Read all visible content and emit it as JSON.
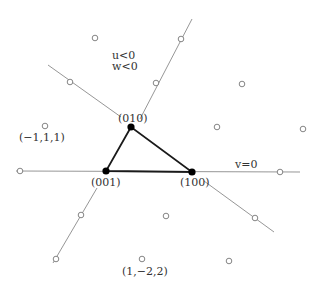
{
  "colors": {
    "background": "#ffffff",
    "thin_line": "#8a8a8a",
    "triangle": "#1a1a1a",
    "vertex": "#000000",
    "open_point_stroke": "#777777",
    "text": "#333333"
  },
  "labels": {
    "vertex_010": "(010)",
    "vertex_001": "(001)",
    "vertex_100": "(100)",
    "region_u": "u<0",
    "region_w": "w<0",
    "line_v0": "v=0",
    "point_m111": "(−1,1,1)",
    "point_1m22": "(1,−2,2)"
  },
  "diagram": {
    "vertices": [
      {
        "id": "010",
        "x": 131,
        "y": 127
      },
      {
        "id": "001",
        "x": 106,
        "y": 171
      },
      {
        "id": "100",
        "x": 192,
        "y": 172
      }
    ],
    "lines": [
      {
        "id": "v0-line",
        "x1": 16,
        "y1": 171,
        "x2": 300,
        "y2": 172
      },
      {
        "id": "upper-left-ray",
        "x1": 48,
        "y1": 65,
        "x2": 121,
        "y2": 117
      },
      {
        "id": "upper-right-ray",
        "x1": 140,
        "y1": 119,
        "x2": 192,
        "y2": 19
      },
      {
        "id": "lower-left-ray",
        "x1": 97,
        "y1": 188,
        "x2": 53,
        "y2": 263
      },
      {
        "id": "lower-right-ray",
        "x1": 204,
        "y1": 181,
        "x2": 274,
        "y2": 232
      }
    ],
    "open_points": [
      {
        "x": 20,
        "y": 171
      },
      {
        "x": 280,
        "y": 172
      },
      {
        "x": 70,
        "y": 82
      },
      {
        "x": 181,
        "y": 39
      },
      {
        "x": 156,
        "y": 83
      },
      {
        "x": 81,
        "y": 215
      },
      {
        "x": 56,
        "y": 259
      },
      {
        "x": 255,
        "y": 218
      },
      {
        "x": 95,
        "y": 38
      },
      {
        "x": 242,
        "y": 84
      },
      {
        "x": 217,
        "y": 127
      },
      {
        "x": 303,
        "y": 129
      },
      {
        "x": 166,
        "y": 216
      },
      {
        "x": 229,
        "y": 261
      },
      {
        "x": 142,
        "y": 259
      },
      {
        "x": 45,
        "y": 126
      }
    ]
  }
}
